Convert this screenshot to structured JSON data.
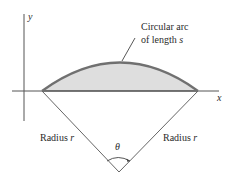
{
  "diagram": {
    "axis_labels": {
      "x": "x",
      "y": "y"
    },
    "arc_label": {
      "line1": "Circular arc",
      "line2_prefix": "of length ",
      "line2_var": "s"
    },
    "radius_left": {
      "prefix": "Radius ",
      "var": "r"
    },
    "radius_right": {
      "prefix": "Radius ",
      "var": "r"
    },
    "angle_label": "θ",
    "colors": {
      "arc": "#707070",
      "fill": "#dcdcdc",
      "lines": "#555555"
    }
  }
}
